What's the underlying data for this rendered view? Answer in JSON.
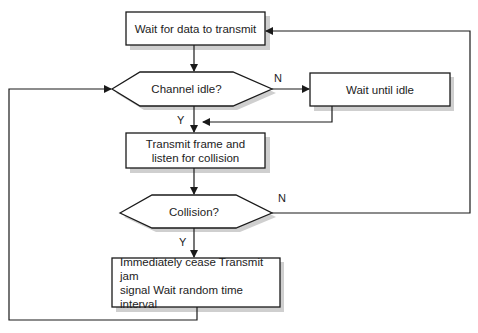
{
  "diagram": {
    "type": "flowchart",
    "title": "",
    "nodes": [
      {
        "id": "wait_data",
        "shape": "rectangle",
        "label": "Wait for data to transmit"
      },
      {
        "id": "channel_idle",
        "shape": "hexagon",
        "label": "Channel idle?"
      },
      {
        "id": "wait_idle",
        "shape": "rectangle",
        "label": "Wait until idle"
      },
      {
        "id": "transmit",
        "shape": "rectangle",
        "label_line1": "Transmit frame and",
        "label_line2": "listen for collision"
      },
      {
        "id": "collision",
        "shape": "hexagon",
        "label": "Collision?"
      },
      {
        "id": "cease",
        "shape": "rectangle",
        "label_line1": "Immediately cease Transmit jam",
        "label_line2": "signal Wait random time interval"
      }
    ],
    "edges": [
      {
        "from": "wait_data",
        "to": "channel_idle",
        "label": ""
      },
      {
        "from": "channel_idle",
        "to": "wait_idle",
        "label": "N"
      },
      {
        "from": "channel_idle",
        "to": "transmit",
        "label": "Y"
      },
      {
        "from": "wait_idle",
        "to": "transmit",
        "label": ""
      },
      {
        "from": "transmit",
        "to": "collision",
        "label": ""
      },
      {
        "from": "collision",
        "to": "wait_data",
        "label": "N"
      },
      {
        "from": "collision",
        "to": "cease",
        "label": "Y"
      },
      {
        "from": "cease",
        "to": "channel_idle",
        "label": ""
      }
    ],
    "edge_labels": {
      "idle_no": "N",
      "idle_yes": "Y",
      "collision_no": "N",
      "collision_yes": "Y"
    },
    "colors": {
      "stroke": "#1a1a1a",
      "fill": "#ffffff",
      "shadow": "#c8c8c8"
    }
  }
}
